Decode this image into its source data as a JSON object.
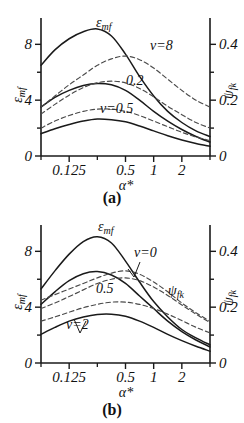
{
  "figure": {
    "background": "#ffffff",
    "ink": "#1a1a1a",
    "solid_color": "#1a1a1a",
    "dashed_color": "#4a4a4a"
  },
  "panels": [
    {
      "id": "a",
      "caption": "(a)",
      "left_axis_title": "ε",
      "left_axis_sub": "mf",
      "right_axis_title": "ψ",
      "right_axis_sub": "fk",
      "x_axis_title": "α*",
      "labels": [
        {
          "name": "epsilon-mf-label",
          "text": "ε",
          "sub": "mf",
          "x": 96,
          "y": 27
        },
        {
          "name": "nu-8-label",
          "text": "ν=8",
          "sub": "",
          "x": 150,
          "y": 50
        },
        {
          "name": "nu-0p2-label",
          "text": "0.2",
          "sub": "",
          "x": 126,
          "y": 85
        },
        {
          "name": "nu-0p5-label",
          "text": "ν=0.5",
          "sub": "",
          "x": 100,
          "y": 113
        }
      ]
    },
    {
      "id": "b",
      "caption": "(b)",
      "left_axis_title": "ε",
      "left_axis_sub": "mf",
      "right_axis_title": "ψ",
      "right_axis_sub": "fk",
      "x_axis_title": "α*",
      "labels": [
        {
          "name": "epsilon-mf-label",
          "text": "ε",
          "sub": "mf",
          "x": 98,
          "y": 24
        },
        {
          "name": "nu-0-label",
          "text": "ν=0",
          "sub": "",
          "x": 134,
          "y": 50
        },
        {
          "name": "nu-0p5-label",
          "text": "0.5",
          "sub": "",
          "x": 96,
          "y": 86
        },
        {
          "name": "nu-2-label",
          "text": "ν=2",
          "sub": "",
          "x": 66,
          "y": 122
        },
        {
          "name": "psi-fk-label",
          "text": "ψ",
          "sub": "fk",
          "x": 168,
          "y": 88
        }
      ]
    }
  ],
  "chart_data": [
    {
      "type": "line",
      "panel": "a",
      "title": "(a)",
      "xlabel": "α*",
      "ylabel": "ε_mf",
      "y2label": "ψ_fk",
      "xscale": "log",
      "xlim": [
        0.0625,
        4.0
      ],
      "xticks": [
        0.125,
        0.5,
        1,
        2
      ],
      "xticklabels": [
        "0.125",
        "0.5",
        "1",
        "2"
      ],
      "xminorticks": [
        0.0625,
        0.25,
        4
      ],
      "ylim": [
        0,
        9.6
      ],
      "yticks": [
        0,
        2,
        4,
        6,
        8
      ],
      "yticklabels": [
        "0",
        "",
        "4",
        "",
        "8"
      ],
      "y2lim": [
        0,
        0.48
      ],
      "y2ticks": [
        0,
        0.1,
        0.2,
        0.3,
        0.4
      ],
      "y2ticklabels": [
        "0",
        "",
        "0.2",
        "",
        "0.4"
      ],
      "grid": false,
      "legend": "inline-annotations",
      "series": [
        {
          "name": "ε_mf, ν=0.5",
          "style": "solid",
          "axis": "left",
          "x": [
            0.0625,
            0.088,
            0.125,
            0.177,
            0.25,
            0.354,
            0.5,
            0.707,
            1.0,
            1.414,
            2.0,
            2.83,
            4.0
          ],
          "y": [
            6.5,
            7.6,
            8.4,
            8.9,
            9.1,
            8.6,
            7.3,
            5.7,
            4.3,
            3.2,
            2.4,
            1.8,
            1.4
          ]
        },
        {
          "name": "ε_mf, ν=2",
          "style": "solid",
          "axis": "left",
          "x": [
            0.0625,
            0.088,
            0.125,
            0.177,
            0.25,
            0.354,
            0.5,
            0.707,
            1.0,
            1.414,
            2.0,
            2.83,
            4.0
          ],
          "y": [
            3.5,
            4.2,
            4.7,
            5.05,
            5.2,
            5.1,
            4.7,
            4.0,
            3.2,
            2.5,
            1.9,
            1.4,
            1.0
          ]
        },
        {
          "name": "ε_mf, ν=8",
          "style": "solid",
          "axis": "left",
          "x": [
            0.0625,
            0.088,
            0.125,
            0.177,
            0.25,
            0.354,
            0.5,
            0.707,
            1.0,
            1.414,
            2.0,
            2.83,
            4.0
          ],
          "y": [
            1.6,
            1.95,
            2.25,
            2.5,
            2.65,
            2.6,
            2.45,
            2.15,
            1.8,
            1.45,
            1.15,
            0.9,
            0.7
          ]
        },
        {
          "name": "ψ_fk, ν=8",
          "style": "dashed",
          "axis": "right",
          "x": [
            0.0625,
            0.088,
            0.125,
            0.177,
            0.25,
            0.354,
            0.5,
            0.707,
            1.0,
            1.414,
            2.0,
            2.83,
            4.0
          ],
          "y": [
            0.175,
            0.215,
            0.255,
            0.29,
            0.325,
            0.348,
            0.358,
            0.345,
            0.315,
            0.275,
            0.235,
            0.2,
            0.175
          ]
        },
        {
          "name": "ψ_fk, ν=0.2",
          "style": "dashed",
          "axis": "right",
          "x": [
            0.0625,
            0.088,
            0.125,
            0.177,
            0.25,
            0.354,
            0.5,
            0.707,
            1.0,
            1.414,
            2.0,
            2.83,
            4.0
          ],
          "y": [
            0.15,
            0.185,
            0.218,
            0.245,
            0.262,
            0.268,
            0.262,
            0.242,
            0.212,
            0.178,
            0.148,
            0.12,
            0.1
          ]
        },
        {
          "name": "ψ_fk, ν=0.5",
          "style": "dashed",
          "axis": "right",
          "x": [
            0.0625,
            0.088,
            0.125,
            0.177,
            0.25,
            0.354,
            0.5,
            0.707,
            1.0,
            1.414,
            2.0,
            2.83,
            4.0
          ],
          "y": [
            0.1,
            0.125,
            0.145,
            0.16,
            0.168,
            0.168,
            0.16,
            0.145,
            0.125,
            0.105,
            0.085,
            0.068,
            0.055
          ]
        }
      ]
    },
    {
      "type": "line",
      "panel": "b",
      "title": "(b)",
      "xlabel": "α*",
      "ylabel": "ε_mf",
      "y2label": "ψ_fk",
      "xscale": "log",
      "xlim": [
        0.0625,
        4.0
      ],
      "xticks": [
        0.125,
        0.5,
        1,
        2
      ],
      "xticklabels": [
        "0.125",
        "0.5",
        "1",
        "2"
      ],
      "xminorticks": [
        0.0625,
        0.25,
        4
      ],
      "ylim": [
        0,
        9.6
      ],
      "yticks": [
        0,
        2,
        4,
        6,
        8
      ],
      "yticklabels": [
        "0",
        "",
        "4",
        "",
        "8"
      ],
      "y2lim": [
        0,
        0.48
      ],
      "y2ticks": [
        0,
        0.1,
        0.2,
        0.3,
        0.4
      ],
      "y2ticklabels": [
        "0",
        "",
        "0.2",
        "",
        "0.4"
      ],
      "grid": false,
      "legend": "inline-annotations",
      "series": [
        {
          "name": "ε_mf, ν=0",
          "style": "solid",
          "axis": "left",
          "x": [
            0.0625,
            0.088,
            0.125,
            0.177,
            0.25,
            0.354,
            0.5,
            0.707,
            1.0,
            1.414,
            2.0,
            2.83,
            4.0
          ],
          "y": [
            5.3,
            6.6,
            7.8,
            8.7,
            9.05,
            8.6,
            7.3,
            5.8,
            4.4,
            3.3,
            2.4,
            1.8,
            1.3
          ]
        },
        {
          "name": "ε_mf, ν=0.5",
          "style": "solid",
          "axis": "left",
          "x": [
            0.0625,
            0.088,
            0.125,
            0.177,
            0.25,
            0.354,
            0.5,
            0.707,
            1.0,
            1.414,
            2.0,
            2.83,
            4.0
          ],
          "y": [
            4.2,
            5.1,
            5.9,
            6.4,
            6.55,
            6.3,
            5.7,
            4.8,
            3.9,
            3.0,
            2.25,
            1.65,
            1.15
          ]
        },
        {
          "name": "ε_mf, ν=2",
          "style": "solid",
          "axis": "left",
          "x": [
            0.0625,
            0.088,
            0.125,
            0.177,
            0.25,
            0.354,
            0.5,
            0.707,
            1.0,
            1.414,
            2.0,
            2.83,
            4.0
          ],
          "y": [
            2.05,
            2.55,
            3.0,
            3.3,
            3.48,
            3.5,
            3.35,
            3.0,
            2.55,
            2.05,
            1.6,
            1.2,
            0.85
          ]
        },
        {
          "name": "ψ_fk, ν=0",
          "style": "dashed",
          "axis": "right",
          "x": [
            0.0625,
            0.088,
            0.125,
            0.177,
            0.25,
            0.354,
            0.5,
            0.707,
            1.0,
            1.414,
            2.0,
            2.83,
            4.0
          ],
          "y": [
            0.225,
            0.245,
            0.265,
            0.285,
            0.305,
            0.322,
            0.33,
            0.318,
            0.29,
            0.255,
            0.215,
            0.18,
            0.15
          ]
        },
        {
          "name": "ψ_fk, ν=0.5",
          "style": "dashed",
          "axis": "right",
          "x": [
            0.0625,
            0.088,
            0.125,
            0.177,
            0.25,
            0.354,
            0.5,
            0.707,
            1.0,
            1.414,
            2.0,
            2.83,
            4.0
          ],
          "y": [
            0.195,
            0.215,
            0.238,
            0.262,
            0.285,
            0.3,
            0.305,
            0.295,
            0.272,
            0.242,
            0.208,
            0.175,
            0.145
          ]
        },
        {
          "name": "ψ_fk, ν=2",
          "style": "dashed",
          "axis": "right",
          "x": [
            0.0625,
            0.088,
            0.125,
            0.177,
            0.25,
            0.354,
            0.5,
            0.707,
            1.0,
            1.414,
            2.0,
            2.83,
            4.0
          ],
          "y": [
            0.15,
            0.165,
            0.182,
            0.198,
            0.21,
            0.218,
            0.218,
            0.21,
            0.195,
            0.175,
            0.152,
            0.128,
            0.108
          ]
        }
      ]
    }
  ]
}
